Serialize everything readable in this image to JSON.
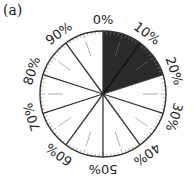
{
  "figure": {
    "label": "(a)",
    "shaded_color": "#2a2a2a",
    "line_color": "#333333",
    "faint_color": "#b0b0b0"
  },
  "chart_data": {
    "type": "pie",
    "title": "(a)",
    "tick_labels": [
      "0%",
      "10%",
      "20%",
      "30%",
      "40%",
      "50%",
      "60%",
      "70%",
      "80%",
      "90%"
    ],
    "major_divisions_percent": [
      0,
      10,
      20,
      30,
      40,
      50,
      60,
      70,
      80,
      90
    ],
    "minor_ticks_percent_step": 1,
    "half_ticks_percent": [
      5,
      15,
      25,
      35,
      45,
      55,
      65,
      75,
      85,
      95
    ],
    "categories": [
      "Shaded",
      "Unshaded"
    ],
    "values": [
      20,
      80
    ],
    "shaded_range_percent": [
      0,
      20
    ]
  }
}
